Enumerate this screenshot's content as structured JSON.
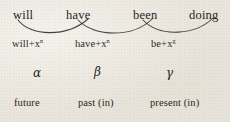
{
  "figure": {
    "background_color": "#e9e5dd",
    "ink_color": "#2a2622",
    "auxiliaries": [
      {
        "label": "will",
        "x": 13,
        "y": 9
      },
      {
        "label": "have",
        "x": 66,
        "y": 9
      },
      {
        "label": "been",
        "x": 133,
        "y": 9
      },
      {
        "label": "doing",
        "x": 189,
        "y": 9
      }
    ],
    "formulas": [
      {
        "base": "will+x",
        "sup": "n",
        "x": 12,
        "y": 39
      },
      {
        "base": "have+x",
        "sup": "n",
        "x": 75,
        "y": 39
      },
      {
        "base": "be+x",
        "sup": "g",
        "x": 151,
        "y": 39
      }
    ],
    "greek_labels": [
      {
        "label": "α",
        "x": 33,
        "y": 67
      },
      {
        "label": "β",
        "x": 94,
        "y": 66
      },
      {
        "label": "γ",
        "x": 166,
        "y": 67
      }
    ],
    "tense_labels": [
      {
        "label": "future",
        "x": 14,
        "y": 98
      },
      {
        "label": "past (in)",
        "x": 78,
        "y": 98
      },
      {
        "label": "present (in)",
        "x": 150,
        "y": 98
      }
    ],
    "arcs": [
      {
        "name": "arc-will-have",
        "d": "M 18 20 C 30 36, 66 38, 88 19"
      },
      {
        "name": "arc-have-been",
        "d": "M 78 20 C 94 37, 133 38, 152 19"
      },
      {
        "name": "arc-been-doing",
        "d": "M 143 20 C 160 38, 196 35, 213 18"
      }
    ]
  }
}
